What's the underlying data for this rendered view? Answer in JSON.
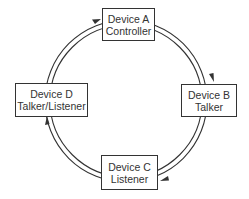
{
  "diagram": {
    "type": "ring-network",
    "direction": "clockwise",
    "colors": {
      "line": "#333333",
      "background": "#ffffff",
      "text": "#333333"
    },
    "devices": [
      {
        "id": "A",
        "name": "Device A",
        "role": "Controller"
      },
      {
        "id": "B",
        "name": "Device B",
        "role": "Talker"
      },
      {
        "id": "C",
        "name": "Device C",
        "role": "Listener"
      },
      {
        "id": "D",
        "name": "Device D",
        "role": "Talker/Listener"
      }
    ],
    "connections": [
      {
        "from": "A",
        "to": "B"
      },
      {
        "from": "B",
        "to": "C"
      },
      {
        "from": "C",
        "to": "D"
      },
      {
        "from": "D",
        "to": "A"
      }
    ]
  }
}
